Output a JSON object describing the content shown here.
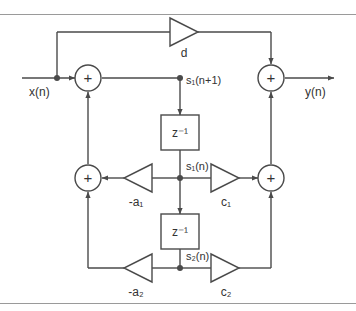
{
  "figure": {
    "type": "signal-flow-diagram",
    "background_color": "#ffffff",
    "line_color": "#4a4a4a",
    "rule_color": "#9a9a9a",
    "text_color": "#333333"
  },
  "labels": {
    "input": "x(n)",
    "output": "y(n)",
    "state_next": "s₁(n+1)",
    "state_1": "s₁(n)",
    "state_2": "s₂(n)",
    "delay_1": "z⁻¹",
    "delay_2": "z⁻¹",
    "gain_d": "d",
    "gain_a1": "-a₁",
    "gain_a2": "-a₂",
    "gain_c1": "c₁",
    "gain_c2": "c₂",
    "adder_symbol": "+"
  },
  "nodes": [
    {
      "name": "input-terminal",
      "label": "x(n)",
      "kind": "terminal"
    },
    {
      "name": "input-tap",
      "label": "",
      "kind": "junction"
    },
    {
      "name": "adder-input",
      "label": "+",
      "kind": "adder"
    },
    {
      "name": "adder-middle-left",
      "label": "+",
      "kind": "adder"
    },
    {
      "name": "adder-output",
      "label": "+",
      "kind": "adder"
    },
    {
      "name": "adder-middle-right",
      "label": "+",
      "kind": "adder"
    },
    {
      "name": "delay-block-1",
      "label": "z⁻¹",
      "kind": "delay"
    },
    {
      "name": "delay-block-2",
      "label": "z⁻¹",
      "kind": "delay"
    },
    {
      "name": "gain-d",
      "label": "d",
      "kind": "gain",
      "direction": "right"
    },
    {
      "name": "gain-a1",
      "label": "-a₁",
      "kind": "gain",
      "direction": "left"
    },
    {
      "name": "gain-a2",
      "label": "-a₂",
      "kind": "gain",
      "direction": "left"
    },
    {
      "name": "gain-c1",
      "label": "c₁",
      "kind": "gain",
      "direction": "right"
    },
    {
      "name": "gain-c2",
      "label": "c₂",
      "kind": "gain",
      "direction": "right"
    },
    {
      "name": "node-s1-next",
      "label": "s₁(n+1)",
      "kind": "junction"
    },
    {
      "name": "node-s1",
      "label": "s₁(n)",
      "kind": "junction"
    },
    {
      "name": "node-s2",
      "label": "s₂(n)",
      "kind": "junction"
    },
    {
      "name": "output-terminal",
      "label": "y(n)",
      "kind": "terminal"
    }
  ]
}
